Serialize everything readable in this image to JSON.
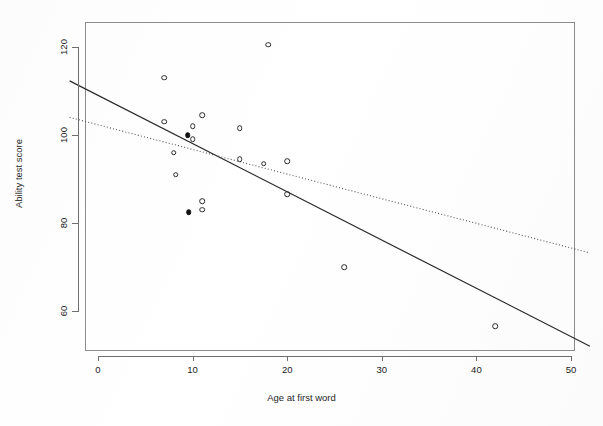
{
  "chart_data": {
    "type": "scatter",
    "title": "",
    "subtitle": "",
    "xlabel": "Age at first word",
    "ylabel": "Ability test score",
    "xlim": [
      -3,
      52
    ],
    "ylim": [
      50,
      127
    ],
    "xticks": [
      0,
      10,
      20,
      30,
      40,
      50
    ],
    "xticklabels": [
      "0",
      "10",
      "20",
      "30",
      "40",
      "50"
    ],
    "yticks": [
      60,
      80,
      100,
      120
    ],
    "yticklabels": [
      "60",
      "80",
      "100",
      "120"
    ],
    "grid": false,
    "legend": "none",
    "marker_styles": {
      "open": "hollow circle (ordinary observation)",
      "filled": "solid circle (highlighted / influential observation)"
    },
    "points": [
      {
        "x": 18,
        "y": 120.5,
        "style": "open"
      },
      {
        "x": 7,
        "y": 113,
        "style": "open"
      },
      {
        "x": 11,
        "y": 104.5,
        "style": "open"
      },
      {
        "x": 7,
        "y": 103,
        "style": "open"
      },
      {
        "x": 10,
        "y": 102,
        "style": "open"
      },
      {
        "x": 15,
        "y": 101.5,
        "style": "open"
      },
      {
        "x": 9.5,
        "y": 100,
        "style": "filled"
      },
      {
        "x": 10,
        "y": 99,
        "style": "open"
      },
      {
        "x": 8,
        "y": 96,
        "style": "open"
      },
      {
        "x": 15,
        "y": 94.5,
        "style": "open"
      },
      {
        "x": 17.5,
        "y": 93.5,
        "style": "open"
      },
      {
        "x": 20,
        "y": 94,
        "style": "open"
      },
      {
        "x": 8.2,
        "y": 91,
        "style": "open"
      },
      {
        "x": 11,
        "y": 85,
        "style": "open"
      },
      {
        "x": 11,
        "y": 83,
        "style": "open"
      },
      {
        "x": 9.6,
        "y": 82.5,
        "style": "filled"
      },
      {
        "x": 20,
        "y": 86.5,
        "style": "open"
      },
      {
        "x": 26,
        "y": 70,
        "style": "open"
      },
      {
        "x": 42,
        "y": 56.5,
        "style": "open"
      }
    ],
    "lines": [
      {
        "name": "regression-all-data",
        "style": "solid",
        "color": "#2a2a2a",
        "x_start": -3,
        "y_start": 112.3,
        "x_end": 52,
        "y_end": 52.0
      },
      {
        "name": "regression-excluding-influential",
        "style": "dotted",
        "color": "#555555",
        "x_start": -3,
        "y_start": 104.0,
        "x_end": 52,
        "y_end": 73.2
      }
    ]
  }
}
